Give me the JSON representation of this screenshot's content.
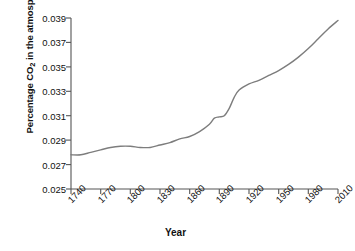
{
  "chart_data": {
    "type": "line",
    "title": "",
    "xlabel": "Year",
    "ylabel": "Percentage CO2 in the atmosphere",
    "ylabel_prefix": "Percentage CO",
    "ylabel_sub": "2",
    "ylabel_suffix": " in the atmosphere",
    "xlim": [
      1740,
      2010
    ],
    "ylim": [
      0.025,
      0.039
    ],
    "grid": false,
    "legend": "none",
    "line_color": "#7d7d7d",
    "axis_color": "#555555",
    "background": "#ffffff",
    "xticks": [
      "1740",
      "1770",
      "1800",
      "1830",
      "1860",
      "1890",
      "1920",
      "1950",
      "1980",
      "2010"
    ],
    "yticks": [
      "0.025",
      "0.027",
      "0.029",
      "0.031",
      "0.033",
      "0.035",
      "0.037",
      "0.039"
    ],
    "xtick_values": [
      1740,
      1770,
      1800,
      1830,
      1860,
      1890,
      1920,
      1950,
      1980,
      2010
    ],
    "ytick_values": [
      0.025,
      0.027,
      0.029,
      0.031,
      0.033,
      0.035,
      0.037,
      0.039
    ],
    "series": [
      {
        "name": "Percentage CO2 in the atmosphere",
        "x": [
          1740,
          1750,
          1760,
          1770,
          1780,
          1790,
          1800,
          1810,
          1820,
          1830,
          1840,
          1850,
          1860,
          1870,
          1880,
          1885,
          1890,
          1895,
          1900,
          1905,
          1910,
          1920,
          1930,
          1940,
          1950,
          1960,
          1970,
          1980,
          1990,
          2000,
          2010
        ],
        "values": [
          0.0278,
          0.0278,
          0.028,
          0.0282,
          0.0284,
          0.0285,
          0.0285,
          0.0284,
          0.0284,
          0.0286,
          0.0288,
          0.0291,
          0.0293,
          0.0297,
          0.0303,
          0.0308,
          0.0309,
          0.031,
          0.0316,
          0.0325,
          0.0331,
          0.0336,
          0.0339,
          0.0343,
          0.0347,
          0.0352,
          0.0358,
          0.0365,
          0.0373,
          0.0381,
          0.0388
        ]
      }
    ]
  }
}
